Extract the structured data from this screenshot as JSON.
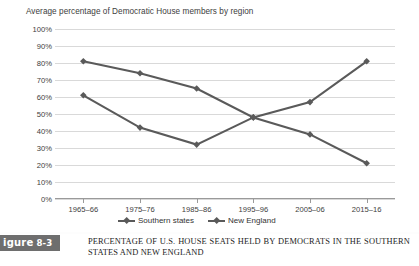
{
  "chart_data": {
    "type": "line",
    "title": "Average percentage of Democratic House members by region",
    "xlabel": "",
    "ylabel": "",
    "categories": [
      "1965–66",
      "1975–76",
      "1985–86",
      "1995–96",
      "2005–06",
      "2015–16"
    ],
    "series": [
      {
        "name": "Southern states",
        "values": [
          81,
          74,
          65,
          48,
          38,
          21
        ],
        "color": "#5a5a5a",
        "marker": "diamond"
      },
      {
        "name": "New England",
        "values": [
          61,
          42,
          32,
          48,
          57,
          81
        ],
        "color": "#5a5a5a",
        "marker": "diamond"
      }
    ],
    "ylim": [
      0,
      100
    ],
    "ytick_labels": [
      "100%",
      "90%",
      "80%",
      "70%",
      "60%",
      "50%",
      "40%",
      "30%",
      "20%",
      "10%",
      "0%"
    ],
    "ytick_values": [
      100,
      90,
      80,
      70,
      60,
      50,
      40,
      30,
      20,
      10,
      0
    ],
    "grid": true,
    "legend_position": "bottom"
  },
  "figure": {
    "tag_word": "igure",
    "tag_number": "8-3",
    "caption": "PERCENTAGE OF U.S. HOUSE SEATS HELD BY DEMOCRATS IN THE SOUTHERN STATES AND NEW ENGLAND"
  },
  "colors": {
    "series": "#5a5a5a",
    "gridline": "#d9d9d9",
    "axis": "#9a9a9a",
    "tag_background": "#6e6e6e",
    "background": "#ffffff"
  }
}
